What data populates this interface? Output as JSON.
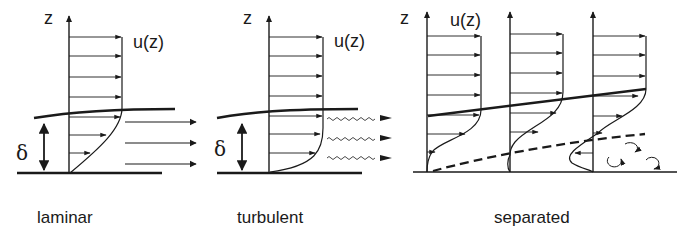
{
  "panels": [
    {
      "id": "laminar",
      "caption": "laminar",
      "axis_label": "z",
      "profile_label": "u(z)",
      "thickness_label": "δ"
    },
    {
      "id": "turbulent",
      "caption": "turbulent",
      "axis_label": "z",
      "profile_label": "u(z)",
      "thickness_label": "δ"
    },
    {
      "id": "separated",
      "caption": "separated",
      "axis_label": "z",
      "profile_label": "u(z)"
    }
  ],
  "colors": {
    "ink": "#1a1a1a",
    "background": "#ffffff"
  }
}
